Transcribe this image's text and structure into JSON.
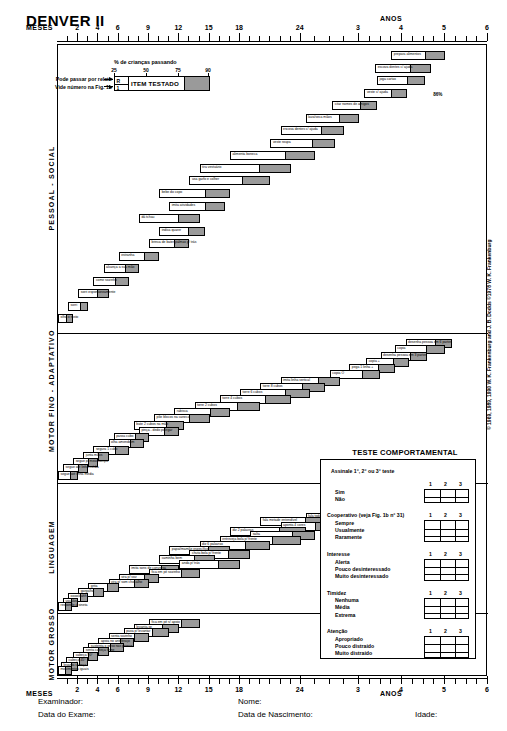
{
  "title": "DENVER II",
  "axis": {
    "unit_months": "MESES",
    "unit_years": "ANOS",
    "month_labels": [
      "2",
      "4",
      "6",
      "9",
      "12",
      "15",
      "18",
      "24"
    ],
    "year_labels": [
      "3",
      "4",
      "5",
      "6"
    ],
    "tick_values_months": [
      1,
      2,
      3,
      4,
      5,
      6,
      7,
      8,
      9,
      10,
      11,
      12,
      13,
      14,
      15,
      16,
      17,
      18,
      19,
      20,
      21,
      22,
      23,
      24,
      27,
      30,
      33,
      36,
      39,
      42,
      45,
      48,
      51,
      54,
      57,
      60,
      63,
      66,
      69,
      72
    ]
  },
  "legend": {
    "title": "% de crianças passando",
    "scale": [
      "25",
      "50",
      "75",
      "90"
    ],
    "item_label": "ITEM TESTADO",
    "r_marker": "R",
    "one_marker": "1",
    "note_report": "Pode passar por relato",
    "note_figure": "Vide número na Fig. 1b"
  },
  "sections": [
    {
      "key": "pessoal-social",
      "label": "PESSOAL - SOCIAL"
    },
    {
      "key": "motor-fino",
      "label": "MOTOR FINO - ADAPTATIVO"
    },
    {
      "key": "linguagem",
      "label": "LINGUAGEM"
    },
    {
      "key": "motor-grosso",
      "label": "MOTOR GROSSO"
    }
  ],
  "annotation_86": "86%",
  "behavioral": {
    "title": "TESTE COMPORTAMENTAL",
    "instruction": "Assinale 1°, 2° ou 3° teste",
    "column_headers": [
      "1",
      "2",
      "3"
    ],
    "groups": [
      {
        "name": "",
        "options": [
          "Sim",
          "Não"
        ]
      },
      {
        "name": "Cooperativo (veja Fig. 1b n° 31)",
        "options": [
          "Sempre",
          "Usualmente",
          "Raramente"
        ]
      },
      {
        "name": "Interesse",
        "options": [
          "Alerta",
          "Pouco desinteressado",
          "Muito desinteressado"
        ]
      },
      {
        "name": "Timidez",
        "options": [
          "Nenhuma",
          "Média",
          "Extrema"
        ]
      },
      {
        "name": "Atenção",
        "options": [
          "Apropriado",
          "Pouco distraído",
          "Muito distraído"
        ]
      }
    ]
  },
  "copyright": "© 1969, 1989, 1990 W. K. Frankenburg and J. B. Dodds ©1978 W. K. Frankenburg",
  "form": {
    "examiner": "Examinador:",
    "exam_date": "Data do Exame:",
    "name": "Nome:",
    "birth_date": "Data de Nascimento:",
    "age": "Idade:"
  },
  "colors": {
    "bar_fill": "#ffffff",
    "bar_gray": "#9a9a9a",
    "outline": "#000000",
    "background": "#ffffff"
  },
  "chart_data": {
    "type": "bar",
    "title": "DENVER II",
    "xlabel": "MESES / ANOS",
    "ylabel": "",
    "note": "Each item bar spans the age range from 25th to 90th percentile of children passing. White portion = 25th-75th percentile, gray portion = 75th-90th percentile.",
    "xlim_months": [
      0,
      72
    ],
    "percentile_marks": [
      25,
      50,
      75,
      90
    ],
    "series": [
      {
        "name": "PESSOAL - SOCIAL",
        "items": [
          {
            "label": "prepara alimentos",
            "p25": 45.0,
            "p90": 60.0,
            "report": false
          },
          {
            "label": "escova dentes c/ ajuda",
            "p25": 40.5,
            "p90": 56.0,
            "report": false
          },
          {
            "label": "joga cartas",
            "p25": 41.0,
            "p90": 54.5,
            "report": false
          },
          {
            "label": "veste c/ ajuda",
            "p25": 37.5,
            "p90": 49.5,
            "report": false
          },
          {
            "label": "citar nomes de amigos",
            "p25": 30.5,
            "p90": 41.0,
            "report": false
          },
          {
            "label": "lava/seca mãos",
            "p25": 25.0,
            "p90": 36.0,
            "report": false
          },
          {
            "label": "escova dentes c/ ajuda",
            "p25": 22.0,
            "p90": 33.0,
            "report": false
          },
          {
            "label": "veste roupa",
            "p25": 21.0,
            "p90": 31.0,
            "report": false
          },
          {
            "label": "alimenta boneca",
            "p25": 17.0,
            "p90": 27.0,
            "report": false
          },
          {
            "label": "tira vestuário",
            "p25": 14.0,
            "p90": 23.0,
            "report": false
          },
          {
            "label": "usa garfo e colher",
            "p25": 13.0,
            "p90": 21.0,
            "report": false
          },
          {
            "label": "bebe do copo",
            "p25": 10.0,
            "p90": 17.0,
            "report": false
          },
          {
            "label": "imita atividades",
            "p25": 11.0,
            "p90": 16.5,
            "report": false
          },
          {
            "label": "dá tchau",
            "p25": 8.0,
            "p90": 14.0,
            "report": false
          },
          {
            "label": "indica quarer",
            "p25": 10.0,
            "p90": 14.5,
            "report": false
          },
          {
            "label": "brinca de bater palmas p/ trás",
            "p25": 9.0,
            "p90": 13.0,
            "report": false
          },
          {
            "label": "estranha",
            "p25": 6.0,
            "p90": 10.0,
            "report": false
          },
          {
            "label": "alcança a sua mão",
            "p25": 4.5,
            "p90": 8.0,
            "report": false
          },
          {
            "label": "come sozinho",
            "p25": 3.5,
            "p90": 7.0,
            "report": false
          },
          {
            "label": "sorri espontaneamente",
            "p25": 2.0,
            "p90": 5.0,
            "report": false
          },
          {
            "label": "sorri",
            "p25": 1.0,
            "p90": 3.0,
            "report": false
          },
          {
            "label": "olha o rosto",
            "p25": 0.0,
            "p90": 1.5,
            "report": false
          }
        ]
      },
      {
        "name": "MOTOR FINO - ADAPTATIVO",
        "items": [
          {
            "label": "desenha pessoa em 6 partes",
            "p25": 49.0,
            "p90": 62.0,
            "report": false
          },
          {
            "label": "copia",
            "p25": 46.0,
            "p90": 60.0,
            "report": false
          },
          {
            "label": "desenha pessoa em 3 partes",
            "p25": 42.0,
            "p90": 55.0,
            "report": false
          },
          {
            "label": "copia +",
            "p25": 38.0,
            "p90": 50.0,
            "report": false
          },
          {
            "label": "pega 1 linha +",
            "p25": 34.0,
            "p90": 46.0,
            "report": false
          },
          {
            "label": "copia O",
            "p25": 30.0,
            "p90": 42.0,
            "report": false
          },
          {
            "label": "imita linha vertical",
            "p25": 22.0,
            "p90": 32.0,
            "report": false
          },
          {
            "label": "torre 8 cubos",
            "p25": 20.0,
            "p90": 29.0,
            "report": false
          },
          {
            "label": "torre 6 cubos",
            "p25": 18.0,
            "p90": 26.0,
            "report": false
          },
          {
            "label": "torre 4 cubos",
            "p25": 16.0,
            "p90": 23.0,
            "report": false
          },
          {
            "label": "torre 2 cubos",
            "p25": 13.5,
            "p90": 20.0,
            "report": false
          },
          {
            "label": "rabisca",
            "p25": 11.5,
            "p90": 17.0,
            "report": false
          },
          {
            "label": "põe blocos na caneca",
            "p25": 9.5,
            "p90": 15.0,
            "report": false
          },
          {
            "label": "bate 2 cubos na mão",
            "p25": 7.5,
            "p90": 12.5,
            "report": false
          },
          {
            "label": "pinça - dedo polegar",
            "p25": 8.0,
            "p90": 12.0,
            "report": false
          },
          {
            "label": "passa cubo",
            "p25": 5.5,
            "p90": 9.0,
            "report": false
          },
          {
            "label": "olha amendoim",
            "p25": 5.0,
            "p90": 8.5,
            "report": false
          },
          {
            "label": "segura 1 cubo",
            "p25": 3.5,
            "p90": 7.0,
            "report": false
          },
          {
            "label": "junta mãos",
            "p25": 2.5,
            "p90": 5.0,
            "report": false
          },
          {
            "label": "segue p/ meio campo",
            "p25": 1.5,
            "p90": 4.0,
            "report": false
          },
          {
            "label": "segue até linha média",
            "p25": 0.5,
            "p90": 3.0,
            "report": false
          },
          {
            "label": "segue até linha média",
            "p25": 0.0,
            "p90": 2.0,
            "report": false
          }
        ]
      },
      {
        "name": "LINGUAGEM",
        "items": [
          {
            "label": "balança o pé/ pé to",
            "p25": 46.0,
            "p90": 62.0,
            "report": false
          },
          {
            "label": "balança o pé p/ 4s",
            "p25": 42.0,
            "p90": 56.0,
            "report": false
          },
          {
            "label": "balança o pé p/ 3s",
            "p25": 38.0,
            "p90": 50.0,
            "report": false
          },
          {
            "label": "balança o pé p/ 2s",
            "p25": 33.0,
            "p90": 44.0,
            "report": false
          },
          {
            "label": "pula",
            "p25": 28.0,
            "p90": 38.0,
            "report": false
          },
          {
            "label": "fala toda entendível",
            "p25": 25.0,
            "p90": 36.0,
            "report": false
          },
          {
            "label": "fala metade entendível",
            "p25": 20.0,
            "p90": 30.0,
            "report": false
          },
          {
            "label": "aponta 4 cores",
            "p25": 22.0,
            "p90": 31.0,
            "report": false
          },
          {
            "label": "diz 2 palavras",
            "p25": 17.0,
            "p90": 25.0,
            "report": false
          },
          {
            "label": "salta",
            "p25": 19.0,
            "p90": 27.0,
            "report": false
          },
          {
            "label": "entreveja bola p/ frente",
            "p25": 16.0,
            "p90": 24.0,
            "report": false
          },
          {
            "label": "diz 6 palavras",
            "p25": 14.0,
            "p90": 21.0,
            "report": false
          },
          {
            "label": "papai/mamãe específico",
            "p25": 11.0,
            "p90": 17.0,
            "report": false
          },
          {
            "label": "chuta bola p/ frente",
            "p25": 13.0,
            "p90": 19.0,
            "report": false
          },
          {
            "label": "caminha bem",
            "p25": 10.0,
            "p90": 15.5,
            "report": false
          },
          {
            "label": "anda p/ trás",
            "p25": 12.0,
            "p90": 18.0,
            "report": false
          },
          {
            "label": "imita sons de conversa",
            "p25": 7.0,
            "p90": 12.0,
            "report": false
          },
          {
            "label": "fica em pé sozinho",
            "p25": 9.0,
            "p90": 14.0,
            "report": false
          },
          {
            "label": "vira p/ voz",
            "p25": 6.0,
            "p90": 10.0,
            "report": false
          },
          {
            "label": "vira p/ som chocalho",
            "p25": 5.0,
            "p90": 9.0,
            "report": false
          },
          {
            "label": "grita",
            "p25": 3.0,
            "p90": 6.0,
            "report": false
          },
          {
            "label": "gargalha",
            "p25": 2.0,
            "p90": 4.5,
            "report": false
          },
          {
            "label": "oooo/aahh",
            "p25": 1.0,
            "p90": 3.0,
            "report": false
          },
          {
            "label": "vocaliza",
            "p25": 0.5,
            "p90": 2.0,
            "report": false
          },
          {
            "label": "responde à sineta",
            "p25": 0.0,
            "p90": 1.0,
            "report": false
          }
        ]
      },
      {
        "name": "MOTOR GROSSO",
        "items": [
          {
            "label": "fica em pé s/ apoio",
            "p25": 9.0,
            "p90": 14.0,
            "report": false
          },
          {
            "label": "levanta-se",
            "p25": 7.5,
            "p90": 12.0,
            "report": false
          },
          {
            "label": "puxa p/ levantar",
            "p25": 6.5,
            "p90": 11.0,
            "report": false
          },
          {
            "label": "senta sozinho",
            "p25": 5.0,
            "p90": 9.0,
            "report": false
          },
          {
            "label": "apoia no antebraço",
            "p25": 4.0,
            "p90": 7.5,
            "report": false
          },
          {
            "label": "sustenta o peso nas pernas",
            "p25": 3.0,
            "p90": 6.5,
            "report": false
          },
          {
            "label": "senta cabeça firme",
            "p25": 2.5,
            "p90": 5.0,
            "report": false
          },
          {
            "label": "cabeça 90°",
            "p25": 1.5,
            "p90": 4.0,
            "report": false
          },
          {
            "label": "cabeça 45°",
            "p25": 0.8,
            "p90": 3.0,
            "report": false
          },
          {
            "label": "levanta cabeça",
            "p25": 0.3,
            "p90": 2.0,
            "report": false
          },
          {
            "label": "movimentos iguais",
            "p25": 0.0,
            "p90": 1.2,
            "report": false
          }
        ]
      }
    ]
  }
}
